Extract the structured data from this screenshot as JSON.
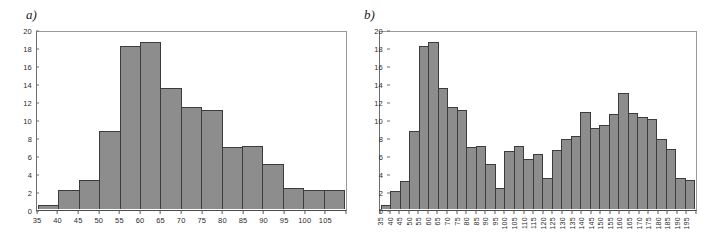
{
  "figure": {
    "background": "#ffffff",
    "bar_fill": "#8d8d8d",
    "bar_border": "#3c3c3c",
    "axis_color": "#5a5a5a"
  },
  "panels": [
    {
      "label": "a)",
      "name": "panel-a"
    },
    {
      "label": "b)",
      "name": "panel-b"
    }
  ],
  "chart_data": [
    {
      "type": "bar",
      "title": "a)",
      "xlabel": "",
      "ylabel": "",
      "grid": false,
      "legend": "none",
      "ylim": [
        0,
        20
      ],
      "yticks": [
        0,
        2,
        4,
        6,
        8,
        10,
        12,
        14,
        16,
        18,
        20
      ],
      "categories": [
        "35",
        "40",
        "45",
        "50",
        "55",
        "60",
        "65",
        "70",
        "75",
        "80",
        "85",
        "90",
        "95",
        "100",
        "105"
      ],
      "values": [
        0.4,
        2.2,
        3.3,
        8.9,
        18.5,
        19.0,
        13.8,
        11.6,
        11.3,
        7.0,
        7.2,
        5.1,
        2.4,
        2.2,
        2.2
      ]
    },
    {
      "type": "bar",
      "title": "b)",
      "xlabel": "",
      "ylabel": "",
      "grid": false,
      "legend": "none",
      "ylim": [
        0,
        20
      ],
      "yticks": [
        0,
        2,
        4,
        6,
        8,
        10,
        12,
        14,
        16,
        18,
        20
      ],
      "categories": [
        "35",
        "40",
        "45",
        "50",
        "55",
        "60",
        "65",
        "70",
        "75",
        "80",
        "85",
        "90",
        "95",
        "100",
        "105",
        "110",
        "115",
        "120",
        "125",
        "130",
        "135",
        "140",
        "145",
        "150",
        "155",
        "160",
        "165",
        "170",
        "175",
        "180",
        "185",
        "190",
        "195"
      ],
      "values": [
        0.4,
        2.1,
        3.2,
        8.9,
        18.5,
        19.0,
        13.8,
        11.6,
        11.3,
        7.0,
        7.15,
        5.1,
        2.4,
        6.6,
        7.2,
        5.7,
        6.3,
        3.55,
        6.7,
        8.0,
        8.25,
        11.05,
        9.2,
        9.55,
        10.85,
        13.2,
        10.95,
        10.45,
        10.2,
        8.0,
        6.8,
        3.55,
        3.3
      ]
    }
  ]
}
